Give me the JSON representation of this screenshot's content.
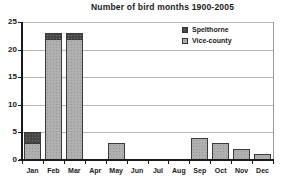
{
  "title": "Number of bird months 1900-2005",
  "legend": {
    "items": [
      {
        "label": "Spelthorne",
        "color": "#474747"
      },
      {
        "label": "Vice-county",
        "color": "#b0b0b0"
      }
    ]
  },
  "chart_data": {
    "type": "bar",
    "stacked": true,
    "title": "Number of bird months 1900-2005",
    "categories": [
      "Jan",
      "Feb",
      "Mar",
      "Apr",
      "May",
      "Jun",
      "Jul",
      "Aug",
      "Sep",
      "Oct",
      "Nov",
      "Dec"
    ],
    "series": [
      {
        "name": "Vice-county",
        "color": "#b0b0b0",
        "values": [
          3,
          22,
          22,
          0,
          3,
          0,
          0,
          0,
          4,
          3,
          2,
          1
        ]
      },
      {
        "name": "Spelthorne",
        "color": "#474747",
        "values": [
          2,
          1,
          1,
          0,
          0,
          0,
          0,
          0,
          0,
          0,
          0,
          0
        ]
      }
    ],
    "totals": [
      5,
      23,
      23,
      0,
      3,
      0,
      0,
      0,
      4,
      3,
      2,
      1
    ],
    "xlabel": "",
    "ylabel": "",
    "ylim": [
      0,
      25
    ],
    "yticks": [
      0,
      5,
      10,
      15,
      20,
      25
    ],
    "grid": true,
    "legend_position": "top-right-inside"
  }
}
